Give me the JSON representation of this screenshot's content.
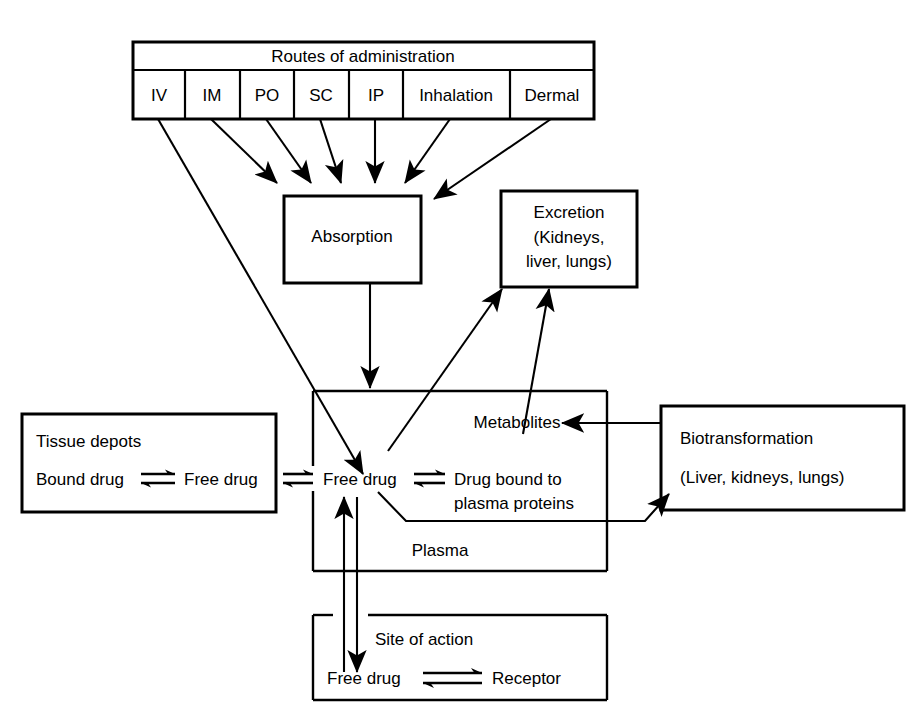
{
  "diagram": {
    "routes_header": "Routes of administration",
    "routes": [
      {
        "label": "IV"
      },
      {
        "label": "IM"
      },
      {
        "label": "PO"
      },
      {
        "label": "SC"
      },
      {
        "label": "IP"
      },
      {
        "label": "Inhalation"
      },
      {
        "label": "Dermal"
      }
    ],
    "absorption": {
      "label": "Absorption"
    },
    "excretion": {
      "line1": "Excretion",
      "line2_prefix": "(",
      "line2_bold": "Kidneys",
      "line2_suffix": ",",
      "line3": "liver, lungs)"
    },
    "tissue_depots": {
      "title": "Tissue depots",
      "left": "Bound drug",
      "equilibrium": "⇌",
      "right": "Free drug"
    },
    "plasma": {
      "metabolites": "Metabolites",
      "free_drug": "Free drug",
      "equilibrium": "⇌",
      "bound_line1": "Drug bound to",
      "bound_line2": "plasma proteins",
      "compartment_label": "Plasma"
    },
    "biotransformation": {
      "line1": "Biotransformation",
      "line2_prefix": "(",
      "line2_bold": "Liver",
      "line2_suffix": ", kidneys, lungs)"
    },
    "site_of_action": {
      "title": "Site of action",
      "left": "Free drug",
      "equilibrium": "⇌",
      "right": "Receptor"
    },
    "external_equilibrium": "⇌",
    "colors": {
      "stroke": "#000000",
      "background": "#ffffff"
    }
  }
}
